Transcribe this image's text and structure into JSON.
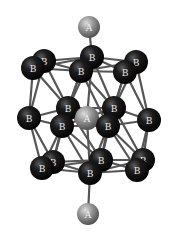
{
  "diagram": {
    "type": "molecular-cluster",
    "colors": {
      "background": "#ffffff",
      "bond": "#555555",
      "atom_b": "#0a0a0a",
      "atom_a": "#8a8a8a"
    },
    "atoms": [
      {
        "id": "A1",
        "label": "A",
        "element": "A",
        "x": 89,
        "y": 27,
        "r": 11
      },
      {
        "id": "B1",
        "label": "B",
        "element": "B",
        "x": 44,
        "y": 61,
        "r": 12
      },
      {
        "id": "B2",
        "label": "B",
        "element": "B",
        "x": 33,
        "y": 68,
        "r": 12
      },
      {
        "id": "B3",
        "label": "B",
        "element": "B",
        "x": 92,
        "y": 57,
        "r": 12
      },
      {
        "id": "B4",
        "label": "B",
        "element": "B",
        "x": 81,
        "y": 71,
        "r": 12
      },
      {
        "id": "B5",
        "label": "B",
        "element": "B",
        "x": 136,
        "y": 62,
        "r": 12
      },
      {
        "id": "B6",
        "label": "B",
        "element": "B",
        "x": 125,
        "y": 72,
        "r": 12
      },
      {
        "id": "B7",
        "label": "B",
        "element": "B",
        "x": 29,
        "y": 118,
        "r": 12
      },
      {
        "id": "B8",
        "label": "B",
        "element": "B",
        "x": 68,
        "y": 108,
        "r": 12
      },
      {
        "id": "B9",
        "label": "B",
        "element": "B",
        "x": 62,
        "y": 126,
        "r": 12
      },
      {
        "id": "A2",
        "label": "A",
        "element": "A",
        "x": 87,
        "y": 118,
        "r": 12
      },
      {
        "id": "B10",
        "label": "B",
        "element": "B",
        "x": 114,
        "y": 108,
        "r": 12
      },
      {
        "id": "B11",
        "label": "B",
        "element": "B",
        "x": 108,
        "y": 126,
        "r": 12
      },
      {
        "id": "B12",
        "label": "B",
        "element": "B",
        "x": 149,
        "y": 120,
        "r": 12
      },
      {
        "id": "B13",
        "label": "B",
        "element": "B",
        "x": 53,
        "y": 162,
        "r": 12
      },
      {
        "id": "B14",
        "label": "B",
        "element": "B",
        "x": 42,
        "y": 168,
        "r": 12
      },
      {
        "id": "B15",
        "label": "B",
        "element": "B",
        "x": 101,
        "y": 160,
        "r": 12
      },
      {
        "id": "B16",
        "label": "B",
        "element": "B",
        "x": 90,
        "y": 173,
        "r": 12
      },
      {
        "id": "B17",
        "label": "B",
        "element": "B",
        "x": 143,
        "y": 160,
        "r": 12
      },
      {
        "id": "B18",
        "label": "B",
        "element": "B",
        "x": 137,
        "y": 170,
        "r": 12
      },
      {
        "id": "A3",
        "label": "A",
        "element": "A",
        "x": 88,
        "y": 214,
        "r": 11
      }
    ]
  }
}
